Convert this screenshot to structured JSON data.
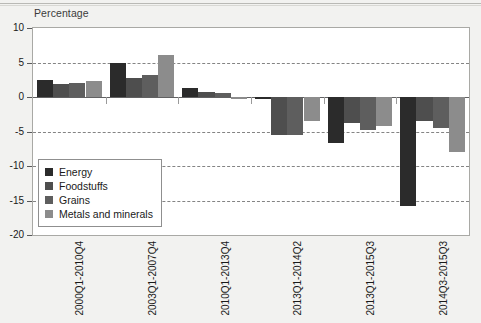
{
  "chart_data": {
    "type": "bar",
    "title": "",
    "subtitle": "",
    "ylabel": "Percentage",
    "xlabel": "",
    "ylim": [
      -20,
      10
    ],
    "yticks": [
      10,
      5,
      0,
      -5,
      -10,
      -15,
      -20
    ],
    "grid": "horizontal-dashed",
    "legend_position": "inside-lower-left",
    "categories": [
      "2000Q1-2010Q4",
      "2003Q1-2007Q4",
      "2010Q1-2013Q4",
      "2013Q1-2014Q2",
      "2013Q1-2015Q3",
      "2014Q3-2015Q3"
    ],
    "series": [
      {
        "name": "Energy",
        "color": "#2b2b2b",
        "values": [
          2.5,
          4.9,
          1.3,
          -0.3,
          -6.7,
          -15.8
        ]
      },
      {
        "name": "Foodstuffs",
        "color": "#4e4e4e",
        "values": [
          1.9,
          2.8,
          0.7,
          -5.5,
          -3.8,
          -3.5
        ]
      },
      {
        "name": "Grains",
        "color": "#5e5e5e",
        "values": [
          2.0,
          3.2,
          0.6,
          -5.5,
          -4.8,
          -4.5
        ]
      },
      {
        "name": "Metals and minerals",
        "color": "#8c8c8c",
        "values": [
          2.3,
          6.1,
          -0.3,
          -3.5,
          -4.2,
          -8.0
        ]
      }
    ]
  },
  "legend": {
    "items": [
      {
        "label": "Energy",
        "color": "#2b2b2b"
      },
      {
        "label": "Foodstuffs",
        "color": "#4e4e4e"
      },
      {
        "label": "Grains",
        "color": "#5e5e5e"
      },
      {
        "label": "Metals and minerals",
        "color": "#8c8c8c"
      }
    ]
  },
  "axes": {
    "y_title": "Percentage",
    "y_tick_labels": [
      "10",
      "5",
      "0",
      "-5",
      "-10",
      "-15",
      "-20"
    ],
    "x_tick_labels": [
      "2000Q1-2010Q4",
      "2003Q1-2007Q4",
      "2010Q1-2013Q4",
      "2013Q1-2014Q2",
      "2013Q1-2015Q3",
      "2014Q3-2015Q3"
    ]
  }
}
